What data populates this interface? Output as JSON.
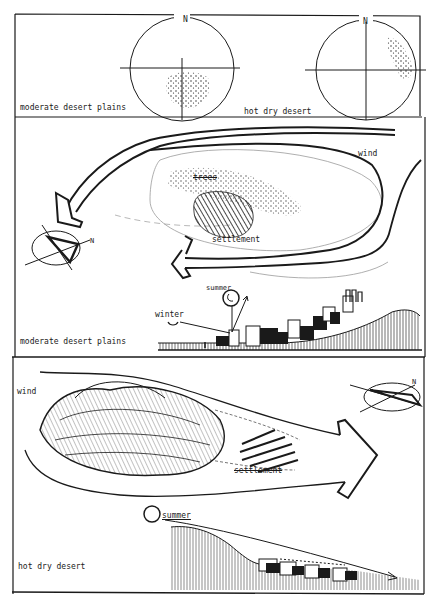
{
  "panel_top": {
    "left_label": "moderate desert plains",
    "right_label": "hot dry desert",
    "compass_left_north": "N",
    "compass_right_north": "N"
  },
  "panel_moderate_plan": {
    "wind_label": "wind",
    "trees_label": "trees",
    "settlement_label": "settlement",
    "compass_north": "N"
  },
  "panel_moderate_section": {
    "summer_label": "summer",
    "winter_label": "winter",
    "region_label": "moderate desert plains"
  },
  "panel_hot_plan": {
    "wind_label": "wind",
    "settlement_label": "settlement",
    "compass_north": "N"
  },
  "panel_hot_section": {
    "summer_label": "summer",
    "region_label": "hot dry desert"
  },
  "colors": {
    "ink": "#1a1a1a",
    "paper": "#ffffff",
    "faint": "#9a9a9a"
  }
}
